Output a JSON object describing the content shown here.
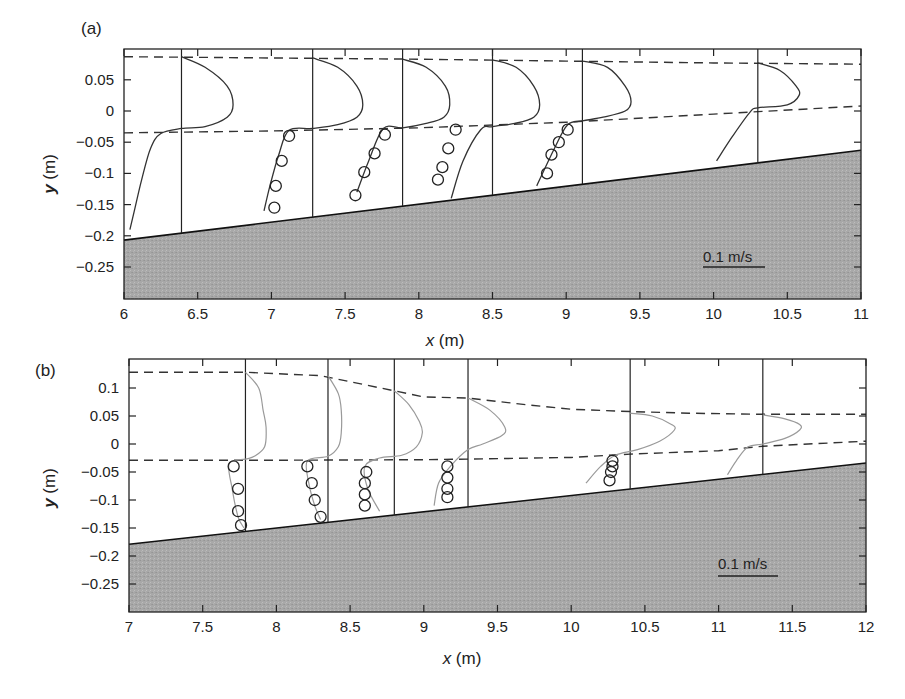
{
  "chart_data": [
    {
      "type": "line",
      "panel_label": "(a)",
      "title": "",
      "xlabel": "x (m)",
      "ylabel": "y (m)",
      "xlim": [
        6,
        11
      ],
      "ylim": [
        -0.3,
        0.1
      ],
      "xticks": [
        "6",
        "6.5",
        "7",
        "7.5",
        "8",
        "8.5",
        "9",
        "9.5",
        "10",
        "10.5",
        "11"
      ],
      "yticks": [
        "0.05",
        "0",
        "−0.05",
        "−0.1",
        "−0.15",
        "−0.2",
        "−0.25"
      ],
      "ytick_values": [
        0.05,
        0,
        -0.05,
        -0.1,
        -0.15,
        -0.2,
        -0.25
      ],
      "grid": false,
      "scale_bar": "0.1 m/s",
      "bed": {
        "x": [
          6,
          11
        ],
        "y": [
          -0.207,
          -0.063
        ]
      },
      "upper_interface": {
        "x": [
          6,
          7,
          8,
          9,
          10,
          11
        ],
        "y": [
          0.087,
          0.085,
          0.083,
          0.08,
          0.077,
          0.075
        ]
      },
      "lower_interface": {
        "x": [
          6,
          7,
          8,
          9,
          10,
          11
        ],
        "y": [
          -0.035,
          -0.032,
          -0.027,
          -0.018,
          -0.005,
          0.008
        ]
      },
      "profile_stations": [
        6.39,
        7.28,
        7.89,
        8.5,
        9.11,
        10.3
      ],
      "profiles": [
        {
          "x0": 6.39,
          "points": [
            [
              6.39,
              0.087
            ],
            [
              6.55,
              0.07
            ],
            [
              6.7,
              0.04
            ],
            [
              6.74,
              0.01
            ],
            [
              6.7,
              -0.01
            ],
            [
              6.55,
              -0.025
            ],
            [
              6.39,
              -0.028
            ],
            [
              6.25,
              -0.036
            ],
            [
              6.18,
              -0.06
            ],
            [
              6.12,
              -0.11
            ],
            [
              6.07,
              -0.16
            ],
            [
              6.04,
              -0.19
            ]
          ]
        },
        {
          "x0": 7.28,
          "points": [
            [
              7.28,
              0.085
            ],
            [
              7.45,
              0.07
            ],
            [
              7.58,
              0.04
            ],
            [
              7.62,
              0.01
            ],
            [
              7.58,
              -0.01
            ],
            [
              7.45,
              -0.022
            ],
            [
              7.28,
              -0.028
            ],
            [
              7.12,
              -0.031
            ],
            [
              7.05,
              -0.07
            ],
            [
              6.99,
              -0.12
            ],
            [
              6.95,
              -0.16
            ]
          ]
        },
        {
          "x0": 7.89,
          "points": [
            [
              7.89,
              0.083
            ],
            [
              8.05,
              0.07
            ],
            [
              8.18,
              0.04
            ],
            [
              8.21,
              0.01
            ],
            [
              8.17,
              -0.01
            ],
            [
              8.05,
              -0.02
            ],
            [
              7.89,
              -0.027
            ],
            [
              7.76,
              -0.028
            ],
            [
              7.66,
              -0.08
            ],
            [
              7.58,
              -0.13
            ]
          ]
        },
        {
          "x0": 8.5,
          "points": [
            [
              8.5,
              0.082
            ],
            [
              8.66,
              0.07
            ],
            [
              8.78,
              0.04
            ],
            [
              8.82,
              0.01
            ],
            [
              8.78,
              -0.01
            ],
            [
              8.65,
              -0.02
            ],
            [
              8.5,
              -0.025
            ],
            [
              8.42,
              -0.03
            ],
            [
              8.3,
              -0.08
            ],
            [
              8.22,
              -0.14
            ]
          ]
        },
        {
          "x0": 9.11,
          "points": [
            [
              9.11,
              0.08
            ],
            [
              9.28,
              0.07
            ],
            [
              9.4,
              0.04
            ],
            [
              9.44,
              0.015
            ],
            [
              9.4,
              0.0
            ],
            [
              9.25,
              -0.01
            ],
            [
              9.11,
              -0.016
            ],
            [
              9.01,
              -0.022
            ],
            [
              8.92,
              -0.06
            ],
            [
              8.8,
              -0.12
            ]
          ]
        },
        {
          "x0": 10.3,
          "points": [
            [
              10.3,
              0.077
            ],
            [
              10.45,
              0.065
            ],
            [
              10.56,
              0.04
            ],
            [
              10.58,
              0.025
            ],
            [
              10.5,
              0.01
            ],
            [
              10.3,
              0.005
            ],
            [
              10.25,
              -0.001
            ],
            [
              10.13,
              -0.04
            ],
            [
              10.02,
              -0.08
            ]
          ]
        }
      ],
      "measurements": [
        {
          "station": 7.28,
          "points": [
            [
              7.12,
              -0.04
            ],
            [
              7.07,
              -0.08
            ],
            [
              7.03,
              -0.12
            ],
            [
              7.02,
              -0.155
            ]
          ]
        },
        {
          "station": 7.89,
          "points": [
            [
              7.77,
              -0.038
            ],
            [
              7.7,
              -0.068
            ],
            [
              7.63,
              -0.098
            ],
            [
              7.57,
              -0.135
            ]
          ]
        },
        {
          "station": 8.5,
          "points": [
            [
              8.25,
              -0.03
            ],
            [
              8.2,
              -0.06
            ],
            [
              8.16,
              -0.09
            ],
            [
              8.13,
              -0.11
            ]
          ]
        },
        {
          "station": 9.11,
          "points": [
            [
              9.01,
              -0.03
            ],
            [
              8.95,
              -0.05
            ],
            [
              8.9,
              -0.07
            ],
            [
              8.87,
              -0.1
            ]
          ]
        }
      ]
    },
    {
      "type": "line",
      "panel_label": "(b)",
      "title": "",
      "xlabel": "x (m)",
      "ylabel": "y (m)",
      "xlim": [
        7,
        12
      ],
      "ylim": [
        -0.3,
        0.15
      ],
      "xticks": [
        "7",
        "7.5",
        "8",
        "8.5",
        "9",
        "9.5",
        "10",
        "10.5",
        "11",
        "11.5",
        "12"
      ],
      "yticks": [
        "0.1",
        "0.05",
        "0",
        "−0.05",
        "−0.1",
        "−0.15",
        "−0.2",
        "−0.25"
      ],
      "ytick_values": [
        0.1,
        0.05,
        0,
        -0.05,
        -0.1,
        -0.15,
        -0.2,
        -0.25
      ],
      "grid": false,
      "scale_bar": "0.1 m/s",
      "bed": {
        "x": [
          7,
          12
        ],
        "y": [
          -0.179,
          -0.034
        ]
      },
      "upper_interface": {
        "x": [
          7,
          7.5,
          7.8,
          8.3,
          8.8,
          9.0,
          9.3,
          9.7,
          10.0,
          10.4,
          10.8,
          11.3,
          12.0
        ],
        "y": [
          0.128,
          0.128,
          0.128,
          0.122,
          0.095,
          0.084,
          0.082,
          0.07,
          0.062,
          0.058,
          0.055,
          0.053,
          0.053
        ]
      },
      "lower_interface": {
        "x": [
          7,
          8,
          9,
          9.3,
          10,
          10.4,
          11,
          11.3,
          12
        ],
        "y": [
          -0.029,
          -0.029,
          -0.028,
          -0.027,
          -0.024,
          -0.018,
          -0.012,
          -0.004,
          0.005
        ]
      },
      "profile_stations": [
        7.79,
        8.35,
        8.8,
        9.3,
        10.4,
        11.3
      ],
      "profiles": [
        {
          "x0": 7.79,
          "points": [
            [
              7.79,
              0.128
            ],
            [
              7.88,
              0.1
            ],
            [
              7.91,
              0.06
            ],
            [
              7.93,
              0.03
            ],
            [
              7.92,
              -0.005
            ],
            [
              7.85,
              -0.022
            ],
            [
              7.79,
              -0.027
            ],
            [
              7.68,
              -0.035
            ],
            [
              7.7,
              -0.08
            ],
            [
              7.74,
              -0.13
            ],
            [
              7.78,
              -0.15
            ]
          ]
        },
        {
          "x0": 8.35,
          "points": [
            [
              8.35,
              0.122
            ],
            [
              8.42,
              0.09
            ],
            [
              8.44,
              0.06
            ],
            [
              8.44,
              0.02
            ],
            [
              8.42,
              -0.005
            ],
            [
              8.35,
              -0.022
            ],
            [
              8.21,
              -0.03
            ],
            [
              8.22,
              -0.07
            ],
            [
              8.26,
              -0.11
            ],
            [
              8.3,
              -0.135
            ]
          ]
        },
        {
          "x0": 8.8,
          "points": [
            [
              8.8,
              0.095
            ],
            [
              8.9,
              0.07
            ],
            [
              8.97,
              0.04
            ],
            [
              8.99,
              0.02
            ],
            [
              8.95,
              -0.005
            ],
            [
              8.85,
              -0.02
            ],
            [
              8.7,
              -0.025
            ],
            [
              8.6,
              -0.04
            ],
            [
              8.62,
              -0.08
            ],
            [
              8.7,
              -0.12
            ]
          ]
        },
        {
          "x0": 9.3,
          "points": [
            [
              9.3,
              0.082
            ],
            [
              9.45,
              0.06
            ],
            [
              9.55,
              0.03
            ],
            [
              9.53,
              0.015
            ],
            [
              9.4,
              0.0
            ],
            [
              9.3,
              -0.01
            ],
            [
              9.18,
              -0.04
            ],
            [
              9.1,
              -0.07
            ],
            [
              9.07,
              -0.11
            ]
          ]
        },
        {
          "x0": 10.4,
          "points": [
            [
              10.4,
              0.055
            ],
            [
              10.55,
              0.05
            ],
            [
              10.68,
              0.035
            ],
            [
              10.7,
              0.025
            ],
            [
              10.6,
              0.005
            ],
            [
              10.45,
              -0.01
            ],
            [
              10.3,
              -0.02
            ],
            [
              10.2,
              -0.04
            ],
            [
              10.1,
              -0.07
            ]
          ]
        },
        {
          "x0": 11.3,
          "points": [
            [
              11.3,
              0.052
            ],
            [
              11.45,
              0.045
            ],
            [
              11.55,
              0.035
            ],
            [
              11.55,
              0.025
            ],
            [
              11.45,
              0.01
            ],
            [
              11.3,
              0.0
            ],
            [
              11.2,
              -0.005
            ],
            [
              11.12,
              -0.03
            ],
            [
              11.06,
              -0.055
            ]
          ]
        }
      ],
      "measurements": [
        {
          "station": 7.79,
          "points": [
            [
              7.71,
              -0.04
            ],
            [
              7.74,
              -0.08
            ],
            [
              7.74,
              -0.12
            ],
            [
              7.76,
              -0.145
            ]
          ]
        },
        {
          "station": 8.35,
          "points": [
            [
              8.21,
              -0.04
            ],
            [
              8.24,
              -0.07
            ],
            [
              8.26,
              -0.1
            ],
            [
              8.3,
              -0.13
            ]
          ]
        },
        {
          "station": 8.8,
          "points": [
            [
              8.61,
              -0.05
            ],
            [
              8.6,
              -0.07
            ],
            [
              8.6,
              -0.09
            ],
            [
              8.6,
              -0.11
            ]
          ]
        },
        {
          "station": 9.3,
          "points": [
            [
              9.16,
              -0.04
            ],
            [
              9.16,
              -0.06
            ],
            [
              9.16,
              -0.08
            ],
            [
              9.16,
              -0.095
            ]
          ]
        },
        {
          "station": 10.4,
          "points": [
            [
              10.28,
              -0.03
            ],
            [
              10.28,
              -0.04
            ],
            [
              10.27,
              -0.05
            ],
            [
              10.26,
              -0.065
            ]
          ]
        }
      ]
    }
  ]
}
